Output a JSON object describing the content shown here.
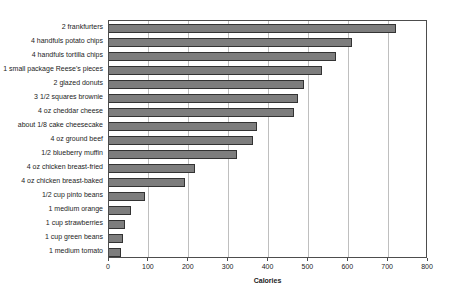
{
  "chart_data": {
    "type": "bar",
    "orientation": "horizontal",
    "xlabel": "Calories",
    "xlim": [
      0,
      800
    ],
    "xticks": [
      0,
      100,
      200,
      300,
      400,
      500,
      600,
      700,
      800
    ],
    "grid": true,
    "legend": false,
    "categories": [
      "2 frankfurters",
      "4 handfuls potato chips",
      "4 handfuls tortilla chips",
      "1 small package Reese's pieces",
      "2 glazed donuts",
      "3 1/2 squares brownie",
      "4 oz cheddar cheese",
      "about 1/8 cake cheesecake",
      "4 oz ground beef",
      "1/2 blueberry muffin",
      "4 oz chicken breast-fried",
      "4 oz chicken breast-baked",
      "1/2 cup pinto beans",
      "1 medium orange",
      "1 cup strawberries",
      "1 cup green beans",
      "1 medium tomato"
    ],
    "values": [
      720,
      610,
      570,
      535,
      490,
      475,
      465,
      370,
      360,
      320,
      215,
      190,
      90,
      55,
      40,
      34,
      29
    ],
    "colors": {
      "bar_fill": "#7d7d7d",
      "bar_border": "#333333",
      "gridline": "#bfbfbf",
      "plot_border": "#4d4d4d",
      "text": "#1c1c1c",
      "background": "#ffffff"
    }
  }
}
